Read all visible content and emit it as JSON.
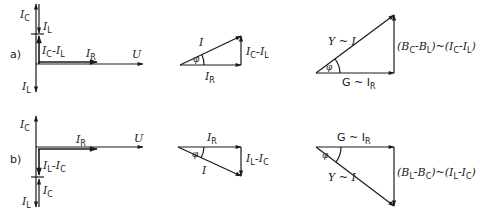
{
  "figure": {
    "colors": {
      "ink": "#1a1a1a",
      "background": "#ffffff"
    }
  },
  "parts": [
    {
      "id": "a",
      "label": "a)",
      "phasor_axes": {
        "reference": "U",
        "vectors": [
          {
            "name": "I_C",
            "main": "I",
            "sub": "C",
            "direction": "up"
          },
          {
            "name": "I_L",
            "main": "I",
            "sub": "L",
            "direction": "down",
            "drawn_from": "tip of I_C"
          },
          {
            "name": "I_C-I_L",
            "main1": "I",
            "sub1": "C",
            "sep": "-",
            "main2": "I",
            "sub2": "L",
            "direction": "up"
          },
          {
            "name": "I_R",
            "main": "I",
            "sub": "R",
            "direction": "right"
          },
          {
            "name": "I_L",
            "main": "I",
            "sub": "L",
            "direction": "down"
          }
        ],
        "labels": {
          "ic": "C",
          "il": "L",
          "ir": "R",
          "u": "U",
          "minus": "-"
        }
      },
      "current_triangle": {
        "hyp": "I",
        "base_main": "I",
        "base_sub": "R",
        "side_main1": "I",
        "side_sub1": "C",
        "side_minus": "-",
        "side_main2": "I",
        "side_sub2": "L",
        "angle": "φ"
      },
      "admittance_triangle": {
        "hyp": "Y ~ I",
        "base": "G ~ I",
        "base_sub": "R",
        "side_open": "(B",
        "side_sub1": "C",
        "side_minus": "-B",
        "side_sub2": "L",
        "side_mid": ")~(I",
        "side_sub3": "C",
        "side_minus2": "-I",
        "side_sub4": "L",
        "side_close": ")",
        "angle": "φ"
      }
    },
    {
      "id": "b",
      "label": "b)",
      "phasor_axes": {
        "reference": "U",
        "labels": {
          "ic": "C",
          "il": "L",
          "ir": "R",
          "u": "U",
          "minus": "-"
        }
      },
      "current_triangle": {
        "hyp": "I",
        "base_main": "I",
        "base_sub": "R",
        "side_main1": "I",
        "side_sub1": "L",
        "side_minus": "-",
        "side_main2": "I",
        "side_sub2": "C",
        "angle": "φ"
      },
      "admittance_triangle": {
        "hyp": "Y ~ I",
        "base": "G ~ I",
        "base_sub": "R",
        "side_open": "(B",
        "side_sub1": "L",
        "side_minus": "-B",
        "side_sub2": "C",
        "side_mid": ")~(I",
        "side_sub3": "L",
        "side_minus2": "-I",
        "side_sub4": "C",
        "side_close": ")",
        "angle": "φ"
      }
    }
  ]
}
